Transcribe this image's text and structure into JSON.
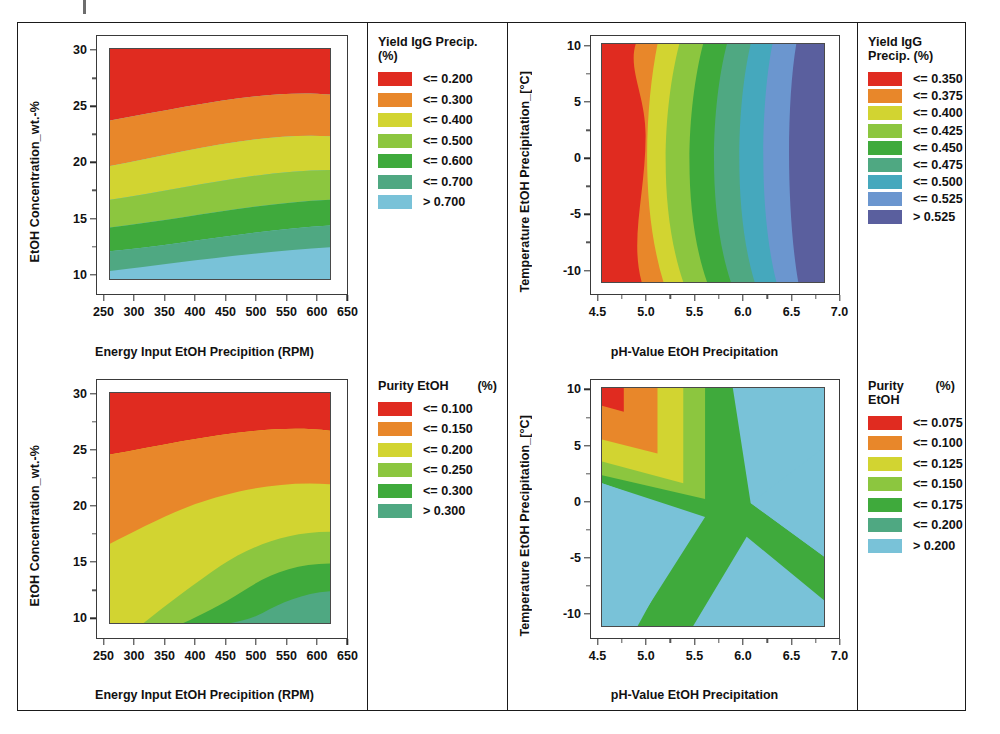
{
  "figure": {
    "background": "#ffffff",
    "panel_count": 4
  },
  "palette": {
    "red": "#e02b20",
    "orange": "#e8872a",
    "yellow_green": "#d2d431",
    "light_green": "#8cc63f",
    "green": "#3faa3c",
    "sea_green": "#4fa882",
    "light_blue": "#79c2d8",
    "teal": "#45a8bd",
    "steel_blue": "#6b96cf",
    "slate_purple": "#5a5f9e"
  },
  "charts": [
    {
      "id": "yield-vs-rpm-concentration",
      "type": "heatmap",
      "title": "",
      "xlabel": "Energy Input EtOH Precipition (RPM)",
      "ylabel": "EtOH Concentration_wt.-%",
      "xlim": [
        250,
        650
      ],
      "ylim": [
        8.5,
        31.5
      ],
      "xticks": [
        "250",
        "300",
        "350",
        "400",
        "450",
        "500",
        "550",
        "600",
        "650"
      ],
      "xtick_values": [
        250,
        300,
        350,
        400,
        450,
        500,
        550,
        600,
        650
      ],
      "yticks": [
        "30",
        "25",
        "20",
        "15",
        "10"
      ],
      "ytick_values": [
        30,
        25,
        20,
        15,
        10
      ],
      "data_extent": {
        "x": [
          300,
          600
        ],
        "y": [
          10,
          30
        ]
      },
      "legend": {
        "title": "Yield IgG Precip. (%)",
        "unit": "",
        "entries": [
          {
            "label": "<= 0.200",
            "color": "#e02b20"
          },
          {
            "label": "<= 0.300",
            "color": "#e8872a"
          },
          {
            "label": "<= 0.400",
            "color": "#d2d431"
          },
          {
            "label": "<= 0.500",
            "color": "#8cc63f"
          },
          {
            "label": "<= 0.600",
            "color": "#3faa3c"
          },
          {
            "label": "<= 0.700",
            "color": "#4fa882"
          },
          {
            "label": "> 0.700",
            "color": "#79c2d8"
          }
        ]
      },
      "band_description": "Near-horizontal bands, yield decreases from high EtOH concentration (red, top) to low concentration (blue, bottom); boundaries slope gently downward toward higher RPM."
    },
    {
      "id": "yield-vs-ph-temperature",
      "type": "heatmap",
      "title": "",
      "xlabel": "pH-Value EtOH Precipitation",
      "ylabel": "Temperature EtOH Precipitation_[°C]",
      "xlim": [
        4.5,
        7.0
      ],
      "ylim": [
        -12,
        12
      ],
      "xticks": [
        "4.5",
        "5.0",
        "5.5",
        "6.0",
        "6.5",
        "7.0"
      ],
      "xtick_values": [
        4.5,
        5.0,
        5.5,
        6.0,
        6.5,
        7.0
      ],
      "yticks": [
        "10",
        "5",
        "0",
        "-5",
        "-10"
      ],
      "ytick_values": [
        10,
        5,
        0,
        -5,
        -10
      ],
      "data_extent": {
        "x": [
          4.75,
          6.75
        ],
        "y": [
          -10,
          10
        ]
      },
      "legend": {
        "title": "Yield IgG Precip. (%)",
        "unit": "",
        "entries": [
          {
            "label": "<= 0.350",
            "color": "#e02b20"
          },
          {
            "label": "<= 0.375",
            "color": "#e8872a"
          },
          {
            "label": "<= 0.400",
            "color": "#d2d431"
          },
          {
            "label": "<= 0.425",
            "color": "#8cc63f"
          },
          {
            "label": "<= 0.450",
            "color": "#3faa3c"
          },
          {
            "label": "<= 0.475",
            "color": "#4fa882"
          },
          {
            "label": "<= 0.500",
            "color": "#45a8bd"
          },
          {
            "label": "<= 0.525",
            "color": "#6b96cf"
          },
          {
            "label": "> 0.525",
            "color": "#5a5f9e"
          }
        ]
      },
      "band_description": "Near-vertical bands, lowest yield (red) at low pH, increasing toward high pH; highest band (purple) confined to upper-right corner at high pH and warm temperature."
    },
    {
      "id": "purity-vs-rpm-concentration",
      "type": "heatmap",
      "title": "",
      "xlabel": "Energy Input EtOH Precipition (RPM)",
      "ylabel": "EtOH Concentration_wt.-%",
      "xlim": [
        250,
        650
      ],
      "ylim": [
        8.5,
        31.5
      ],
      "xticks": [
        "250",
        "300",
        "350",
        "400",
        "450",
        "500",
        "550",
        "600",
        "650"
      ],
      "xtick_values": [
        250,
        300,
        350,
        400,
        450,
        500,
        550,
        600,
        650
      ],
      "yticks": [
        "30",
        "25",
        "20",
        "15",
        "10"
      ],
      "ytick_values": [
        30,
        25,
        20,
        15,
        10
      ],
      "data_extent": {
        "x": [
          300,
          600
        ],
        "y": [
          10,
          30
        ]
      },
      "legend": {
        "title": "Purity EtOH",
        "unit": "(%)",
        "entries": [
          {
            "label": "<= 0.100",
            "color": "#e02b20"
          },
          {
            "label": "<= 0.150",
            "color": "#e8872a"
          },
          {
            "label": "<= 0.200",
            "color": "#d2d431"
          },
          {
            "label": "<= 0.250",
            "color": "#8cc63f"
          },
          {
            "label": "<= 0.300",
            "color": "#3faa3c"
          },
          {
            "label": "> 0.300",
            "color": "#4fa882"
          }
        ]
      },
      "band_description": "Diagonal bands running from upper-left to lower-right; red at top, sea-green lowest values in bottom-right corner."
    },
    {
      "id": "purity-vs-ph-temperature",
      "type": "heatmap",
      "title": "",
      "xlabel": "pH-Value EtOH Precipitation",
      "ylabel": "Temperature EtOH Precipitation_[°C]",
      "xlim": [
        4.5,
        7.0
      ],
      "ylim": [
        -12,
        12
      ],
      "xticks": [
        "4.5",
        "5.0",
        "5.5",
        "6.0",
        "6.5",
        "7.0"
      ],
      "xtick_values": [
        4.5,
        5.0,
        5.5,
        6.0,
        6.5,
        7.0
      ],
      "yticks": [
        "10",
        "5",
        "0",
        "-5",
        "-10"
      ],
      "ytick_values": [
        10,
        5,
        0,
        -5,
        -10
      ],
      "data_extent": {
        "x": [
          4.75,
          6.75
        ],
        "y": [
          -10,
          10
        ]
      },
      "legend": {
        "title": "Purity EtOH",
        "unit": "(%)",
        "entries": [
          {
            "label": "<= 0.075",
            "color": "#e02b20"
          },
          {
            "label": "<= 0.100",
            "color": "#e8872a"
          },
          {
            "label": "<= 0.125",
            "color": "#d2d431"
          },
          {
            "label": "<= 0.150",
            "color": "#8cc63f"
          },
          {
            "label": "<= 0.175",
            "color": "#3faa3c"
          },
          {
            "label": "<= 0.200",
            "color": "#4fa882"
          },
          {
            "label": "> 0.200",
            "color": "#79c2d8"
          }
        ]
      },
      "band_description": "Saddle pattern: small red hotspot in the upper-left corner surrounded by nested orange/yellow corner bands; a green Y-shaped ridge radiates right and down, with light-blue regions in the upper-right and lower-left."
    }
  ]
}
